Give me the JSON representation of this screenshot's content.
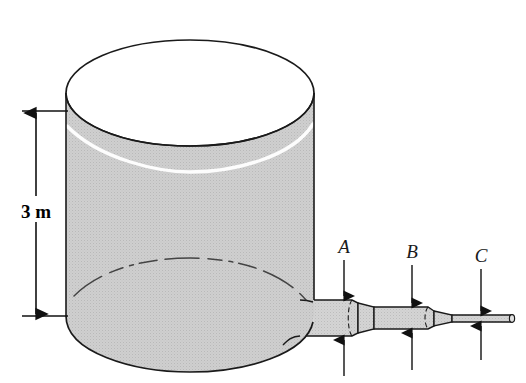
{
  "figure": {
    "name": "water-tank-with-stepped-discharge-pipe",
    "background_color": "#ffffff",
    "outline_color": "#1a1a1a",
    "fluid_fill_color": "#c9c9c9",
    "fluid_highlight_color": "#ffffff",
    "pipe_fill_color": "#cdcdcd"
  },
  "dimension": {
    "label": "3 m",
    "description": "vertical depth dimension from water surface to tank bottom",
    "arrow_style": "double-headed"
  },
  "stations": [
    {
      "id": "A",
      "label": "A",
      "note": "widest pipe section nearest tank"
    },
    {
      "id": "B",
      "label": "B",
      "note": "intermediate pipe section"
    },
    {
      "id": "C",
      "label": "C",
      "note": "narrowest pipe section at outlet"
    }
  ],
  "tank": {
    "shape": "vertical cylinder with rounded bottom",
    "top_state": "open",
    "liquid_state": "filled to level below rim"
  }
}
